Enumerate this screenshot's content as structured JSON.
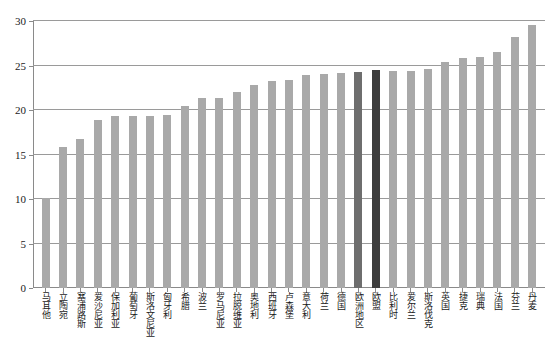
{
  "chart_data": {
    "type": "bar",
    "title": "",
    "subtitle": "",
    "xlabel": "",
    "ylabel": "",
    "ylim": [
      0,
      30
    ],
    "yticks": [
      0,
      5,
      10,
      15,
      20,
      25,
      30
    ],
    "grid": true,
    "legend": "none",
    "colors": {
      "bar": "#a9a9a9",
      "highlight_region": "#6e6e6e",
      "highlight_eu": "#3d3d3d",
      "axis": "#8a8a8a",
      "gridline": "#9a9a9a",
      "background": "#ffffff"
    },
    "categories": [
      "马耳他",
      "立陶宛",
      "塞浦路斯",
      "爱沙尼亚",
      "保加利亚",
      "葡萄牙",
      "斯洛文尼亚",
      "匈牙利",
      "希腊",
      "波兰",
      "罗马尼亚",
      "拉脱维亚",
      "奥地利",
      "西班牙",
      "卢森堡",
      "意大利",
      "荷兰",
      "德国",
      "欧洲地区",
      "欧盟",
      "比利时",
      "爱尔兰",
      "斯洛伐克",
      "英国",
      "捷克",
      "瑞典",
      "法国",
      "芬兰",
      "丹麦"
    ],
    "values": [
      10.1,
      15.9,
      16.7,
      18.9,
      19.3,
      19.3,
      19.3,
      19.4,
      20.5,
      21.3,
      21.3,
      22.0,
      22.8,
      23.3,
      23.4,
      23.9,
      24.0,
      24.2,
      24.3,
      24.5,
      24.4,
      24.4,
      24.6,
      25.4,
      25.9,
      26.0,
      26.5,
      28.2,
      29.5
    ],
    "highlight": {
      "欧洲地区": "highlight_region",
      "欧盟": "highlight_eu"
    }
  }
}
